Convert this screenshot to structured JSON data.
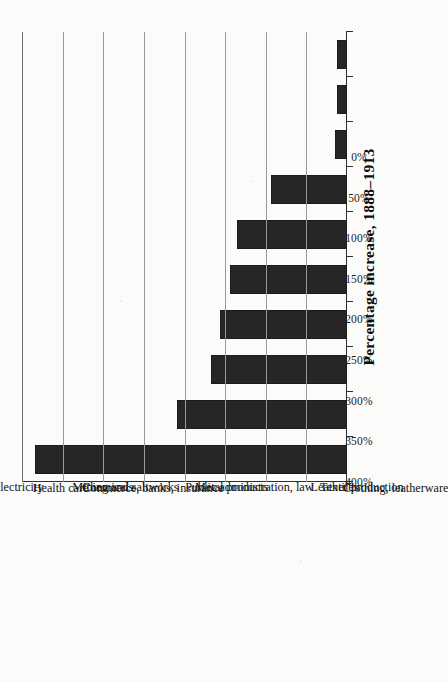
{
  "figure": {
    "axis_title": "Percentage increase, 1888–1913",
    "bar_color": "#262626",
    "gridline_color": "#9a9a9a",
    "axis_color": "#2f2f2f",
    "background_color": "#fbfbfa",
    "orientation": "page-rotated-90-ccw"
  },
  "chart_data": {
    "type": "bar",
    "title": "Percentage increase, 1888–1913",
    "xlabel": "",
    "ylabel": "Percentage increase, 1888–1913",
    "ylim": [
      0,
      400
    ],
    "ytick_labels": [
      "0%",
      "50%",
      "100%",
      "150%",
      "200%",
      "250%",
      "300%",
      "350%",
      "400%"
    ],
    "yticks": [
      0,
      50,
      100,
      150,
      200,
      250,
      300,
      350,
      400
    ],
    "grid": true,
    "legend": "none",
    "categories": [
      "Gas, water, electricity",
      "Health care",
      "Chemicals",
      "Mining and saltworks",
      "Commerce, banks, insurance",
      "Metal products",
      "Public administration, law",
      "Textiles",
      "Leather production",
      "Clothing, leatherware"
    ],
    "values": [
      384,
      209,
      167,
      156,
      144,
      135,
      93,
      15,
      12,
      12
    ]
  }
}
